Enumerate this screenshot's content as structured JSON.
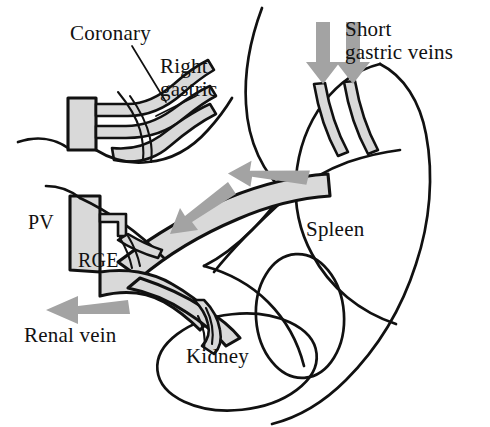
{
  "figure": {
    "type": "anatomical-line-diagram",
    "background_color": "#ffffff",
    "line_color": "#111111",
    "vessel_fill_color": "#d9d9d9",
    "arrow_color": "#a3a3a3"
  },
  "labels": [
    {
      "id": "coronary",
      "text": "Coronary",
      "x": 70,
      "y": 22,
      "anchor": "start"
    },
    {
      "id": "right_gastric",
      "text": "Right\ngastric",
      "x": 160,
      "y": 55,
      "anchor": "start"
    },
    {
      "id": "short_gastric",
      "text": "Short\ngastric veins",
      "x": 345,
      "y": 18,
      "anchor": "start"
    },
    {
      "id": "pv",
      "text": "PV",
      "x": 28,
      "y": 212,
      "anchor": "start"
    },
    {
      "id": "rge",
      "text": "RGE",
      "x": 78,
      "y": 250,
      "anchor": "start"
    },
    {
      "id": "renal_vein",
      "text": "Renal vein",
      "x": 24,
      "y": 324,
      "anchor": "start"
    },
    {
      "id": "spleen",
      "text": "Spleen",
      "x": 306,
      "y": 218,
      "anchor": "start"
    },
    {
      "id": "kidney",
      "text": "Kidney",
      "x": 186,
      "y": 345,
      "anchor": "start"
    }
  ],
  "flow_arrows": [
    {
      "id": "short-gastric-arrow-1",
      "direction": "down",
      "color": "#a3a3a3"
    },
    {
      "id": "short-gastric-arrow-2",
      "direction": "down",
      "color": "#a3a3a3"
    },
    {
      "id": "splenic-vein-arrow-1",
      "direction": "left",
      "color": "#a3a3a3"
    },
    {
      "id": "splenic-vein-arrow-2",
      "direction": "left-down",
      "color": "#a3a3a3"
    },
    {
      "id": "renal-vein-arrow",
      "direction": "left",
      "color": "#a3a3a3"
    }
  ],
  "structures": [
    {
      "id": "portal-vein-trunk",
      "label": "PV",
      "filled": true
    },
    {
      "id": "coronary-vein",
      "label": "Coronary",
      "filled": true
    },
    {
      "id": "right-gastric-vein",
      "label": "Right gastric",
      "filled": true
    },
    {
      "id": "short-gastric-veins",
      "label": "Short gastric veins",
      "filled": true
    },
    {
      "id": "rge-vein",
      "label": "RGE",
      "filled": true
    },
    {
      "id": "splenic-vein",
      "label": "Splenic vein",
      "filled": true
    },
    {
      "id": "renal-vein",
      "label": "Renal vein",
      "filled": true
    },
    {
      "id": "spleen-outline",
      "label": "Spleen",
      "filled": false
    },
    {
      "id": "kidney-outline",
      "label": "Kidney",
      "filled": false
    },
    {
      "id": "stomach-outline",
      "label": "Stomach",
      "filled": false
    }
  ]
}
